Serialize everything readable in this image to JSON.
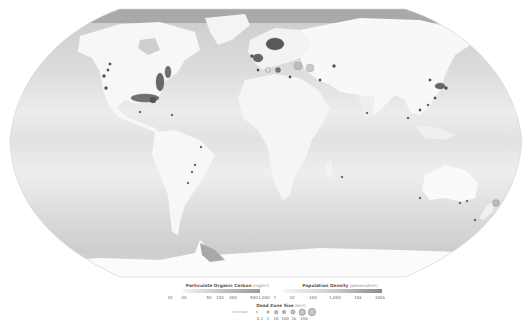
{
  "map": {
    "projection": "robinson",
    "ocean_shading": "gray gradient representing particulate organic carbon",
    "land_shading": "gray representing population density",
    "features": [
      "North America",
      "South America",
      "Europe",
      "Africa",
      "Asia",
      "Australia",
      "Antarctica",
      "Greenland"
    ],
    "dead_zone_clusters": [
      "US East Coast",
      "Gulf of Mexico",
      "US West Coast",
      "Northern Europe / Baltic",
      "Mediterranean",
      "East Asia",
      "Southeast Asia",
      "South America East Coast",
      "New Zealand"
    ]
  },
  "legend": {
    "poc": {
      "title": "Particulate Organic Carbon",
      "unit": "(mg/m³)",
      "ticks": [
        "10",
        "20",
        "50",
        "100",
        "200",
        "500",
        "1,000"
      ]
    },
    "population": {
      "title": "Population Density",
      "unit": "(persons/km²)",
      "ticks": [
        "1",
        "10",
        "100",
        "1,000",
        "10k",
        "100k"
      ]
    },
    "dead_zone": {
      "title": "Dead Zone Size",
      "unit": "(km²)",
      "unknown_label": "unknown",
      "ticks": [
        "0.1",
        "1",
        "10",
        "100",
        "1k",
        "10k"
      ]
    }
  },
  "colors": {
    "ocean_light": "#e6e6e6",
    "ocean_dark": "#c4c4c4",
    "land": "#f6f6f6",
    "dead_zone": "#555555"
  }
}
